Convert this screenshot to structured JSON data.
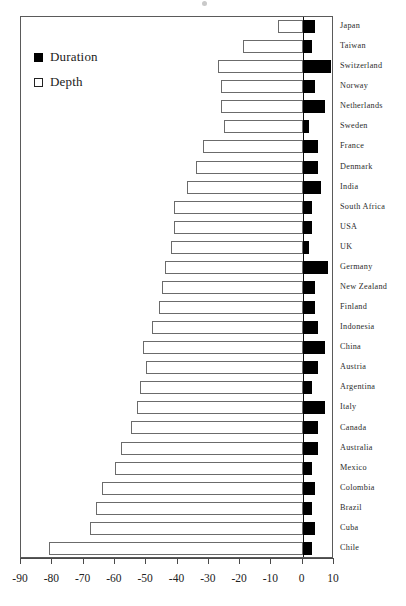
{
  "chart_data": {
    "type": "bar",
    "orientation": "horizontal",
    "title": "",
    "subtitle": "",
    "xlabel": "",
    "ylabel": "",
    "xlim": [
      -90,
      10
    ],
    "xticks": [
      -90,
      -80,
      -70,
      -60,
      -50,
      -40,
      -30,
      -20,
      -10,
      0,
      10
    ],
    "xticklabels": [
      "-90",
      "-80",
      "-70",
      "-60",
      "-50",
      "-40",
      "-30",
      "-20",
      "-10",
      "0",
      "10"
    ],
    "grid": false,
    "legend_position": "upper-left",
    "categories": [
      "Japan",
      "Taiwan",
      "Switzerland",
      "Norway",
      "Netherlands",
      "Sweden",
      "France",
      "Denmark",
      "India",
      "South Africa",
      "USA",
      "UK",
      "Germany",
      "New Zealand",
      "Finland",
      "Indonesia",
      "China",
      "Austria",
      "Argentina",
      "Italy",
      "Canada",
      "Australia",
      "Mexico",
      "Colombia",
      "Brazil",
      "Cuba",
      "Chile"
    ],
    "series": [
      {
        "name": "Depth",
        "color": "#ffffff",
        "edgecolor": "#6b6b6b",
        "values": [
          -8,
          -19,
          -27,
          -26,
          -26,
          -25,
          -32,
          -34,
          -37,
          -41,
          -41,
          -42,
          -44,
          -45,
          -46,
          -48,
          -51,
          -50,
          -52,
          -53,
          -55,
          -58,
          -60,
          -64,
          -66,
          -68,
          -81
        ]
      },
      {
        "name": "Duration",
        "color": "#000000",
        "edgecolor": "#000000",
        "values": [
          4,
          3,
          9,
          4,
          7,
          2,
          5,
          5,
          6,
          3,
          3,
          2,
          8,
          4,
          4,
          5,
          7,
          5,
          3,
          7,
          5,
          5,
          3,
          4,
          3,
          4,
          3
        ]
      }
    ]
  },
  "legend": {
    "items": [
      {
        "label": "Duration",
        "marker": "filled-square",
        "color": "#000000"
      },
      {
        "label": "Depth",
        "marker": "hollow-square",
        "color": "#ffffff"
      }
    ]
  }
}
